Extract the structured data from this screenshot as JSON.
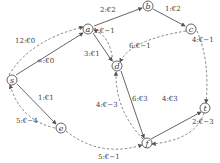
{
  "diagram": {
    "type": "flow-network",
    "nodes": [
      {
        "id": "s",
        "label": "s",
        "x": 12,
        "y": 80
      },
      {
        "id": "a",
        "label": "a",
        "x": 88,
        "y": 29
      },
      {
        "id": "b",
        "label": "b",
        "x": 148,
        "y": 6
      },
      {
        "id": "c",
        "label": "c",
        "x": 191,
        "y": 29
      },
      {
        "id": "d",
        "label": "d",
        "x": 117,
        "y": 66
      },
      {
        "id": "e",
        "label": "e",
        "x": 61,
        "y": 128
      },
      {
        "id": "f",
        "label": "f",
        "x": 147,
        "y": 143
      },
      {
        "id": "t",
        "label": "t",
        "x": 205,
        "y": 108
      }
    ],
    "edges": [
      {
        "from": "a",
        "to": "b",
        "label": "2:€2",
        "style": "solid",
        "lx": 100,
        "ly": 12
      },
      {
        "from": "b",
        "to": "c",
        "label": "1:€2",
        "style": "solid",
        "lx": 165,
        "ly": 11
      },
      {
        "from": "a",
        "to": "d",
        "label": "3:€1",
        "style": "solid",
        "lx": 98,
        "ly": 55
      },
      {
        "from": "s",
        "to": "a",
        "label": "∞:€0",
        "style": "solid",
        "lx": 40,
        "ly": 63
      },
      {
        "from": "s",
        "to": "e",
        "label": "1:€1",
        "style": "solid",
        "lx": 40,
        "ly": 100
      },
      {
        "from": "d",
        "to": "f",
        "label": "6:€3",
        "style": "solid",
        "lx": 135,
        "ly": 96
      },
      {
        "from": "f",
        "to": "t",
        "label": "4:€3",
        "style": "solid",
        "lx": 163,
        "ly": 99
      },
      {
        "from": "s",
        "to": "a",
        "label": "12:€0",
        "style": "dashed",
        "lx": 17,
        "ly": 42
      },
      {
        "from": "d",
        "to": "a",
        "label": "1:€−1",
        "style": "dashed",
        "lx": 93,
        "ly": 33
      },
      {
        "from": "c",
        "to": "d",
        "label": "6:€−1",
        "style": "dashed",
        "lx": 141,
        "ly": 48
      },
      {
        "from": "c",
        "to": "t",
        "label": "4:€−1",
        "style": "dashed",
        "lx": 193,
        "ly": 41
      },
      {
        "from": "f",
        "to": "d",
        "label": "4:€−3",
        "style": "dashed",
        "lx": 86,
        "ly": 108
      },
      {
        "from": "e",
        "to": "s",
        "label": "5:€−4",
        "style": "dashed",
        "lx": 15,
        "ly": 122
      },
      {
        "from": "t",
        "to": "f",
        "label": "2:€−3",
        "style": "dashed",
        "lx": 192,
        "ly": 123
      },
      {
        "from": "e",
        "to": "f",
        "label": "5:€−1",
        "style": "dashed",
        "lx": 97,
        "ly": 157
      }
    ]
  },
  "colors": {
    "line": "#555555",
    "dashed_line": "#777777",
    "text": "#444444",
    "background": "#ffffff"
  }
}
